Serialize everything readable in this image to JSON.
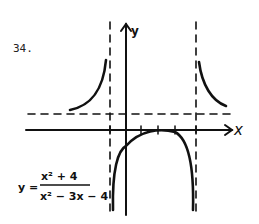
{
  "problem": {
    "number": "34."
  },
  "graph": {
    "x_label": "x",
    "y_label": "y",
    "equation": {
      "lhs": "y =",
      "numerator": "x² + 4",
      "denominator": "x² − 3x − 4"
    },
    "vertical_asymptotes": [
      "x = -1",
      "x = 4"
    ],
    "horizontal_asymptote": "y = 1",
    "ink_color": "#111111"
  }
}
